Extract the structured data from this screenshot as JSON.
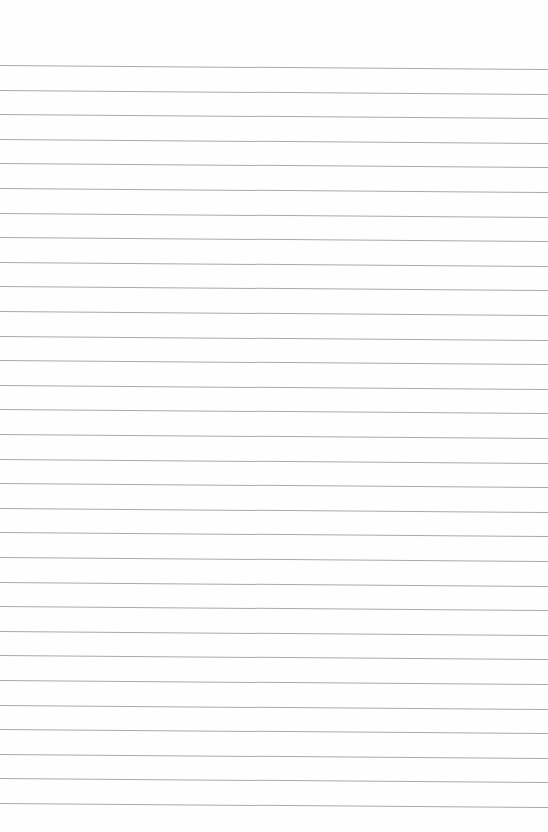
{
  "page": {
    "type": "lined-paper",
    "background_color": "#fefefe",
    "line_color": "#a9a9a9",
    "line_count": 31,
    "first_line_y": 65,
    "line_spacing": 24.6
  }
}
